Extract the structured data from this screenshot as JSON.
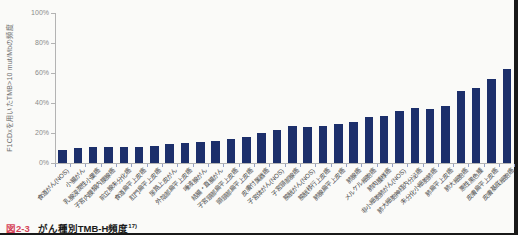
{
  "page": {
    "background": "#fafaf8",
    "edge_color": "#191919"
  },
  "caption": {
    "figure_label": "図2-3",
    "figure_label_color": "#d6455a",
    "title": "がん種別TMB-H頻度",
    "reference": "17)"
  },
  "chart_data": {
    "type": "bar",
    "title": "",
    "xlabel": "",
    "ylabel": "F1CDxを用いたTMB>10 mut/Mbの頻度",
    "ylim": [
      0,
      100
    ],
    "yticks": [
      "0%",
      "20%",
      "40%",
      "60%",
      "80%",
      "100%"
    ],
    "grid": false,
    "legend": false,
    "bar_color": "#1c2f6b",
    "categories": [
      "食道がん(NOS)",
      "小腸がん",
      "乳腺浸潤性小葉癌",
      "子宮内膜類内膜腺癌",
      "前立腺未分化癌",
      "食道扁平上皮癌",
      "肛門扁平上皮癌",
      "尿路上皮がん",
      "外陰部扁平上皮癌",
      "唾液腺がん",
      "結腸・直腸がん",
      "子宮頸部扁平上皮癌",
      "頭頸部扁平上皮癌",
      "皮膚付属器癌",
      "子宮体がん(NOS)",
      "子宮頸部腺癌",
      "膀胱がん(NOS)",
      "膀胱移行上皮癌",
      "肺腺扁平上皮癌",
      "肺腺癌",
      "メルケル細胞癌",
      "肺肉腫様癌",
      "非小細胞肺がん(NOS)",
      "肺大細胞神経内分泌癌",
      "未分化小細胞肺癌",
      "肺扁平上皮癌",
      "肺大細胞癌",
      "悪性黒色腫",
      "皮膚扁平上皮癌",
      "皮膚基底細胞癌"
    ],
    "values": [
      9,
      10,
      10.5,
      11,
      11,
      11,
      11.5,
      13,
      13.5,
      14,
      14.5,
      16,
      17.5,
      20,
      22,
      24.5,
      24,
      25,
      26,
      27.5,
      31,
      31.5,
      34.5,
      36.5,
      36,
      38,
      48,
      50,
      56,
      63
    ]
  }
}
